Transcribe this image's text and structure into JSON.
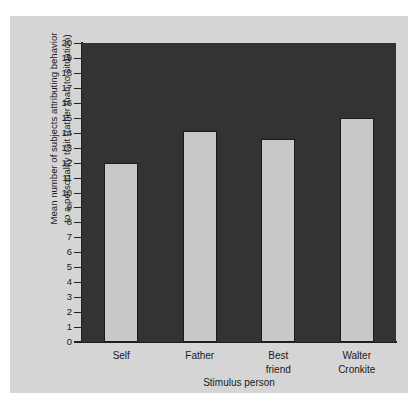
{
  "chart_data": {
    "type": "bar",
    "title": "",
    "categories": [
      "Self",
      "Father",
      "Best\nfriend",
      "Walter\nCronkite"
    ],
    "values": [
      12.0,
      14.1,
      13.6,
      15.0
    ],
    "xlabel": "Stimulus person",
    "ylabel": "Mean number of subjects attributing behavior\nto a personality trait (rather than to situation)",
    "ylim": [
      0,
      20
    ],
    "ytick_step": 1,
    "ytick_labels": [
      "0",
      "1",
      "2",
      "3",
      "4",
      "5",
      "6",
      "7",
      "8",
      "9",
      "10",
      "11",
      "12",
      "13",
      "14",
      "15",
      "16",
      "17",
      "18",
      "19",
      "20"
    ],
    "grid": false,
    "legend": null,
    "colors": {
      "bar_fill": "#c8c8c8",
      "bar_edge": "#1a1a1a",
      "plot_background": "#333333",
      "figure_background": "#d5d5d5",
      "page_background": "#ffffff",
      "axis": "#202020",
      "text": "#1a1a1a"
    }
  }
}
